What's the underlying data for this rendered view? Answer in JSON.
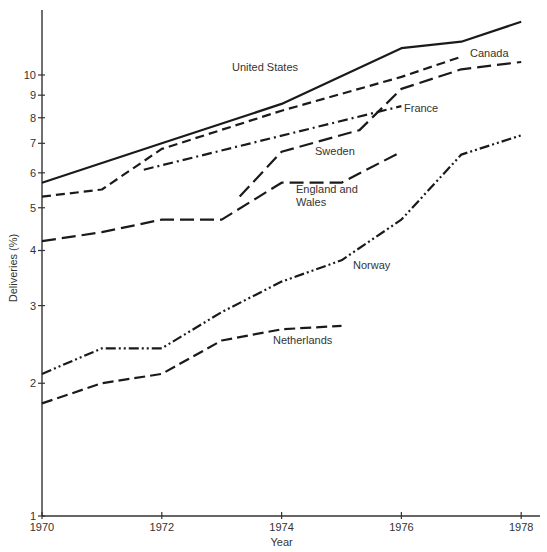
{
  "chart_data": {
    "type": "line",
    "title": "",
    "xlabel": "Year",
    "ylabel": "Deliveries (%)",
    "yscale": "log",
    "xlim": [
      1970,
      1978.3
    ],
    "ylim": [
      1,
      14
    ],
    "grid": false,
    "legend": "inline labels",
    "x_ticks": [
      1970,
      1972,
      1974,
      1976,
      1978
    ],
    "x_tick_labels": [
      "1970",
      "1972",
      "1974",
      "1976",
      "1978"
    ],
    "y_ticks": [
      1,
      2,
      3,
      4,
      5,
      6,
      7,
      8,
      9,
      10
    ],
    "y_tick_labels": [
      "1",
      "2",
      "3",
      "4",
      "5",
      "6",
      "7",
      "8",
      "9",
      "10"
    ],
    "series": [
      {
        "name": "United States",
        "style": "solid",
        "x": [
          1970,
          1972,
          1974,
          1976,
          1977,
          1978
        ],
        "values": [
          5.7,
          7.0,
          8.6,
          11.5,
          11.9,
          13.2
        ],
        "label_pos": [
          232,
          71
        ]
      },
      {
        "name": "Canada",
        "style": "short-dash",
        "x": [
          1970,
          1971,
          1972,
          1974,
          1976,
          1977
        ],
        "values": [
          5.3,
          5.5,
          6.8,
          8.3,
          9.9,
          11.0
        ],
        "label_pos": [
          470,
          57
        ]
      },
      {
        "name": "France",
        "style": "dash-dot",
        "x": [
          1971.7,
          1976
        ],
        "values": [
          6.1,
          8.5
        ],
        "label_pos": [
          404,
          112
        ]
      },
      {
        "name": "Sweden",
        "style": "long-dash",
        "x": [
          1973.3,
          1974,
          1975.3,
          1976,
          1977,
          1978
        ],
        "values": [
          5.3,
          6.7,
          7.5,
          9.3,
          10.3,
          10.7
        ],
        "label_pos": [
          315,
          155
        ]
      },
      {
        "name": "England and Wales",
        "label_lines": [
          "England and",
          "Wales"
        ],
        "style": "long-dash",
        "x": [
          1970,
          1971,
          1972,
          1973,
          1974,
          1975,
          1976
        ],
        "values": [
          4.2,
          4.4,
          4.7,
          4.7,
          5.7,
          5.7,
          6.7
        ],
        "label_pos": [
          296,
          193
        ]
      },
      {
        "name": "Norway",
        "style": "dash-dot-dot",
        "x": [
          1970,
          1971,
          1972,
          1973,
          1974,
          1975,
          1976,
          1977,
          1978
        ],
        "values": [
          2.1,
          2.4,
          2.4,
          2.9,
          3.4,
          3.8,
          4.7,
          6.6,
          7.3
        ],
        "label_pos": [
          353,
          269
        ]
      },
      {
        "name": "Netherlands",
        "style": "dash",
        "x": [
          1970,
          1971,
          1972,
          1973,
          1974,
          1975
        ],
        "values": [
          1.8,
          2.0,
          2.1,
          2.5,
          2.65,
          2.7
        ],
        "label_pos": [
          273,
          344
        ]
      }
    ]
  },
  "layout": {
    "plot_left": 42,
    "plot_right": 540,
    "plot_top": 10,
    "plot_bottom": 516,
    "x0_year": 1970,
    "px_per_year": 59.9,
    "px_per_decade": 441
  },
  "dash_patterns": {
    "solid": "",
    "short-dash": "9 5",
    "long-dash": "14 6",
    "dash": "11 5",
    "dash-dot": "10 4 2 4",
    "dash-dot-dot": "10 3 2 3 2 3"
  }
}
